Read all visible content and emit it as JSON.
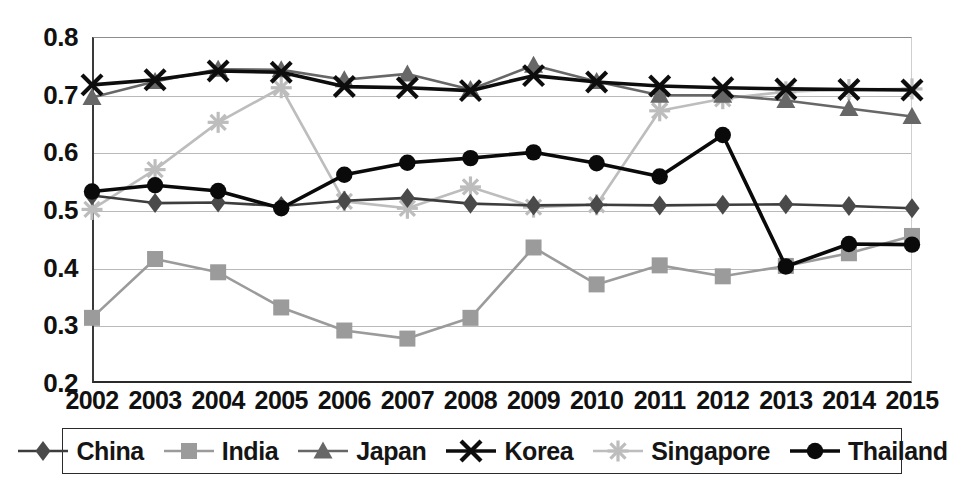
{
  "chart_data": {
    "type": "line",
    "title": "",
    "xlabel": "",
    "ylabel": "",
    "grid": true,
    "legend_position": "bottom",
    "xlim": [
      2002,
      2015
    ],
    "ylim": [
      0.2,
      0.8
    ],
    "ytick_labels": [
      "0.8",
      "0.7",
      "0.6",
      "0.5",
      "0.4",
      "0.3",
      "0.2"
    ],
    "ytick_values": [
      0.8,
      0.7,
      0.6,
      0.5,
      0.4,
      0.3,
      0.2
    ],
    "categories": [
      "2002",
      "2003",
      "2004",
      "2005",
      "2006",
      "2007",
      "2008",
      "2009",
      "2010",
      "2011",
      "2012",
      "2013",
      "2014",
      "2015"
    ],
    "series": [
      {
        "name": "China",
        "marker": "diamond",
        "color": "#4a4a4a",
        "line_color": "#3d3d3d",
        "values": [
          0.525,
          0.512,
          0.513,
          0.507,
          0.516,
          0.521,
          0.511,
          0.508,
          0.509,
          0.508,
          0.509,
          0.51,
          0.507,
          0.503
        ]
      },
      {
        "name": "India",
        "marker": "square",
        "color": "#9b9b9b",
        "line_color": "#9b9b9b",
        "values": [
          0.313,
          0.415,
          0.392,
          0.331,
          0.291,
          0.277,
          0.313,
          0.435,
          0.371,
          0.404,
          0.385,
          0.403,
          0.425,
          0.455
        ]
      },
      {
        "name": "Japan",
        "marker": "triangle",
        "color": "#676767",
        "line_color": "#676767",
        "values": [
          0.695,
          0.723,
          0.744,
          0.743,
          0.726,
          0.736,
          0.709,
          0.751,
          0.723,
          0.699,
          0.699,
          0.69,
          0.676,
          0.662
        ]
      },
      {
        "name": "Korea",
        "marker": "cross",
        "color": "#0d0d0d",
        "line_color": "#0d0d0d",
        "values": [
          0.717,
          0.726,
          0.741,
          0.739,
          0.714,
          0.712,
          0.707,
          0.733,
          0.722,
          0.715,
          0.712,
          0.71,
          0.709,
          0.708
        ]
      },
      {
        "name": "Singapore",
        "marker": "asterisk",
        "color": "#bdbdbd",
        "line_color": "#bdbdbd",
        "values": [
          0.501,
          0.57,
          0.652,
          0.712,
          0.515,
          0.503,
          0.54,
          0.505,
          0.509,
          0.672,
          0.693,
          0.705,
          0.709,
          0.71
        ]
      },
      {
        "name": "Thailand",
        "marker": "circle",
        "color": "#0a0a0a",
        "line_color": "#0a0a0a",
        "values": [
          0.532,
          0.543,
          0.533,
          0.503,
          0.561,
          0.582,
          0.59,
          0.6,
          0.581,
          0.558,
          0.63,
          0.402,
          0.441,
          0.44
        ]
      }
    ]
  },
  "legend": {
    "items": [
      {
        "label": "China"
      },
      {
        "label": "India"
      },
      {
        "label": "Japan"
      },
      {
        "label": "Korea"
      },
      {
        "label": "Singapore"
      },
      {
        "label": "Thailand"
      }
    ]
  },
  "caption": {
    "text": ""
  }
}
